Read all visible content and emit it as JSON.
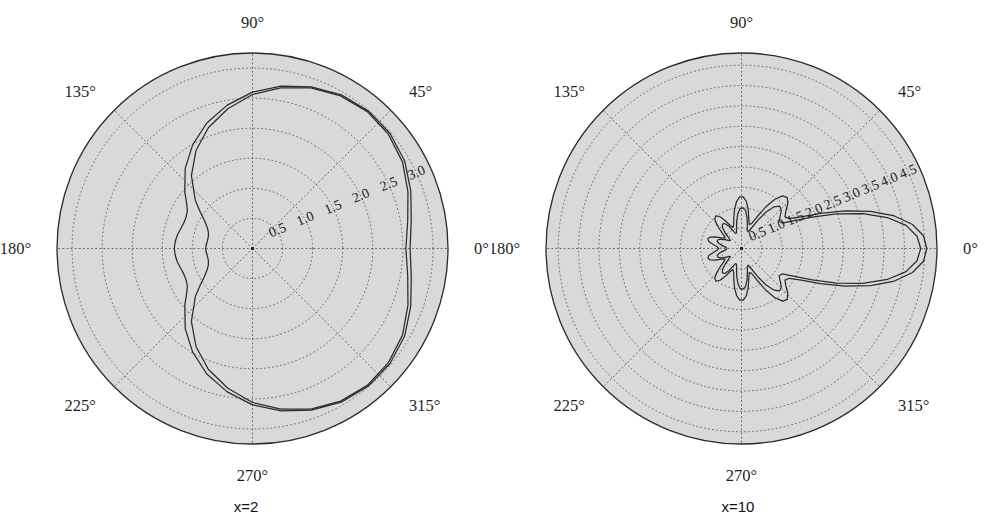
{
  "figure": {
    "panels": [
      {
        "id": "panel-x2",
        "caption": "x=2",
        "center": {
          "x": 252.5,
          "y": 248.5
        },
        "radius": 195.5,
        "angle_ticks": [
          "0°",
          "45°",
          "90°",
          "135°",
          "180°",
          "225°",
          "270°",
          "315°"
        ],
        "angle_tick_values": [
          0,
          45,
          90,
          135,
          180,
          225,
          270,
          315
        ],
        "radial_ticks": [
          "0.5",
          "1.0",
          "1.5",
          "2.0",
          "2.5",
          "3.0"
        ],
        "radial_tick_values": [
          0.5,
          1.0,
          1.5,
          2.0,
          2.5,
          3.0
        ],
        "rmax": 3.25,
        "radial_label_angle": 22.5
      },
      {
        "id": "panel-x10",
        "caption": "x=10",
        "center": {
          "x": 249.5,
          "y": 248.5
        },
        "radius": 195.5,
        "angle_ticks": [
          "0°",
          "45°",
          "90°",
          "135°",
          "180°",
          "225°",
          "270°",
          "315°"
        ],
        "angle_tick_values": [
          0,
          45,
          90,
          135,
          180,
          225,
          270,
          315
        ],
        "radial_ticks": [
          "0.5",
          "1.0",
          "1.5",
          "2.0",
          "2.5",
          "3.0",
          "3.5",
          "4.0",
          "4.5"
        ],
        "radial_tick_values": [
          0.5,
          1.0,
          1.5,
          2.0,
          2.5,
          3.0,
          3.5,
          4.0,
          4.5
        ],
        "rmax": 4.8,
        "radial_label_angle": 22.5
      }
    ]
  },
  "style": {
    "bg_fill": "#d9d9d9",
    "grid_color": "#4a4a4a",
    "outline_color": "#2a2a2a",
    "curve_color": "#2b2b2b",
    "text_color": "#1f1f1f",
    "page_bg": "#ffffff"
  },
  "chart_data": {
    "type": "line",
    "subtype": "polar",
    "title": "",
    "xlabel": "",
    "ylabel": "",
    "grid": true,
    "legend_position": "none",
    "panels": [
      {
        "caption": "x=2",
        "rlim": [
          0,
          3.25
        ],
        "rticks": [
          0.5,
          1.0,
          1.5,
          2.0,
          2.5,
          3.0
        ],
        "thetaticks": [
          0,
          45,
          90,
          135,
          180,
          225,
          270,
          315
        ],
        "series": [
          {
            "name": "curve-1",
            "theta_deg": [
              0,
              10,
              20,
              30,
              40,
              50,
              60,
              70,
              80,
              90,
              100,
              110,
              120,
              130,
              140,
              145,
              150,
              155,
              160,
              165,
              170,
              175,
              180,
              185,
              190,
              195,
              200,
              205,
              210,
              215,
              220,
              230,
              240,
              250,
              260,
              270,
              280,
              290,
              300,
              310,
              320,
              330,
              340,
              350,
              360
            ],
            "r": [
              2.62,
              2.68,
              2.8,
              2.92,
              2.98,
              2.99,
              2.95,
              2.86,
              2.74,
              2.6,
              2.42,
              2.22,
              1.99,
              1.74,
              1.47,
              1.34,
              1.25,
              1.22,
              1.22,
              1.24,
              1.27,
              1.29,
              1.3,
              1.29,
              1.27,
              1.24,
              1.22,
              1.22,
              1.25,
              1.34,
              1.47,
              1.74,
              1.99,
              2.22,
              2.42,
              2.6,
              2.74,
              2.86,
              2.95,
              2.99,
              2.98,
              2.92,
              2.8,
              2.68,
              2.62
            ]
          },
          {
            "name": "curve-2",
            "theta_deg": [
              0,
              10,
              20,
              30,
              40,
              50,
              60,
              70,
              80,
              90,
              100,
              110,
              120,
              130,
              140,
              145,
              150,
              155,
              160,
              165,
              170,
              175,
              180,
              185,
              190,
              195,
              200,
              205,
              210,
              215,
              220,
              230,
              240,
              250,
              260,
              270,
              280,
              290,
              300,
              310,
              320,
              330,
              340,
              350,
              360
            ],
            "r": [
              2.55,
              2.62,
              2.75,
              2.88,
              2.95,
              2.97,
              2.93,
              2.84,
              2.71,
              2.56,
              2.36,
              2.14,
              1.88,
              1.58,
              1.24,
              1.06,
              0.92,
              0.83,
              0.78,
              0.76,
              0.76,
              0.77,
              0.78,
              0.77,
              0.76,
              0.76,
              0.78,
              0.83,
              0.92,
              1.06,
              1.24,
              1.58,
              1.88,
              2.14,
              2.36,
              2.56,
              2.71,
              2.84,
              2.93,
              2.97,
              2.95,
              2.88,
              2.75,
              2.62,
              2.55
            ]
          }
        ]
      },
      {
        "caption": "x=10",
        "rlim": [
          0,
          4.8
        ],
        "rticks": [
          0.5,
          1.0,
          1.5,
          2.0,
          2.5,
          3.0,
          3.5,
          4.0,
          4.5
        ],
        "thetaticks": [
          0,
          45,
          90,
          135,
          180,
          225,
          270,
          315
        ],
        "series": [
          {
            "name": "curve-1",
            "theta_deg": [
              0,
              4,
              8,
              12,
              16,
              20,
              24,
              28,
              32,
              36,
              40,
              44,
              48,
              52,
              56,
              60,
              64,
              68,
              72,
              76,
              80,
              84,
              88,
              92,
              96,
              100,
              104,
              108,
              112,
              116,
              120,
              124,
              128,
              132,
              136,
              140,
              144,
              148,
              152,
              156,
              160,
              164,
              168,
              172,
              176,
              180,
              184,
              188,
              192,
              196,
              200,
              204,
              208,
              212,
              216,
              220,
              224,
              228,
              232,
              236,
              240,
              244,
              248,
              252,
              256,
              260,
              264,
              268,
              272,
              276,
              280,
              284,
              288,
              292,
              296,
              300,
              304,
              308,
              312,
              316,
              320,
              324,
              328,
              332,
              336,
              340,
              344,
              348,
              352,
              356,
              360
            ],
            "r": [
              4.55,
              4.48,
              4.24,
              3.84,
              3.3,
              2.7,
              2.12,
              1.66,
              1.38,
              1.32,
              1.42,
              1.58,
              1.68,
              1.64,
              1.45,
              1.16,
              0.86,
              0.66,
              0.62,
              0.74,
              0.96,
              1.16,
              1.27,
              1.27,
              1.16,
              0.98,
              0.78,
              0.62,
              0.56,
              0.62,
              0.78,
              0.94,
              1.02,
              0.98,
              0.84,
              0.66,
              0.52,
              0.48,
              0.56,
              0.7,
              0.82,
              0.86,
              0.82,
              0.7,
              0.6,
              0.56,
              0.6,
              0.7,
              0.82,
              0.86,
              0.82,
              0.7,
              0.56,
              0.48,
              0.52,
              0.66,
              0.84,
              0.98,
              1.02,
              0.94,
              0.78,
              0.62,
              0.56,
              0.62,
              0.78,
              0.98,
              1.16,
              1.27,
              1.27,
              1.16,
              0.96,
              0.74,
              0.62,
              0.66,
              0.86,
              1.16,
              1.45,
              1.64,
              1.68,
              1.58,
              1.42,
              1.32,
              1.38,
              1.66,
              2.12,
              2.7,
              3.3,
              3.84,
              4.24,
              4.48,
              4.55
            ]
          },
          {
            "name": "curve-2",
            "theta_deg": [
              0,
              4,
              8,
              12,
              16,
              20,
              24,
              28,
              32,
              36,
              40,
              44,
              48,
              52,
              56,
              60,
              64,
              68,
              72,
              76,
              80,
              84,
              88,
              92,
              96,
              100,
              104,
              108,
              112,
              116,
              120,
              124,
              128,
              132,
              136,
              140,
              144,
              148,
              152,
              156,
              160,
              164,
              168,
              172,
              176,
              180,
              184,
              188,
              192,
              196,
              200,
              204,
              208,
              212,
              216,
              220,
              224,
              228,
              232,
              236,
              240,
              244,
              248,
              252,
              256,
              260,
              264,
              268,
              272,
              276,
              280,
              284,
              288,
              292,
              296,
              300,
              304,
              308,
              312,
              316,
              320,
              324,
              328,
              332,
              336,
              340,
              344,
              348,
              352,
              356,
              360
            ],
            "r": [
              4.4,
              4.32,
              4.08,
              3.66,
              3.1,
              2.48,
              1.9,
              1.44,
              1.18,
              1.14,
              1.24,
              1.36,
              1.4,
              1.3,
              1.08,
              0.8,
              0.56,
              0.44,
              0.46,
              0.6,
              0.78,
              0.94,
              1.0,
              0.98,
              0.86,
              0.68,
              0.5,
              0.4,
              0.4,
              0.5,
              0.64,
              0.74,
              0.76,
              0.7,
              0.56,
              0.42,
              0.34,
              0.36,
              0.46,
              0.56,
              0.62,
              0.62,
              0.56,
              0.46,
              0.38,
              0.36,
              0.38,
              0.46,
              0.56,
              0.62,
              0.62,
              0.56,
              0.46,
              0.36,
              0.34,
              0.42,
              0.56,
              0.7,
              0.76,
              0.74,
              0.64,
              0.5,
              0.4,
              0.4,
              0.5,
              0.68,
              0.86,
              0.98,
              1.0,
              0.94,
              0.78,
              0.6,
              0.46,
              0.44,
              0.56,
              0.8,
              1.08,
              1.3,
              1.4,
              1.36,
              1.24,
              1.14,
              1.18,
              1.44,
              1.9,
              2.48,
              3.1,
              3.66,
              4.08,
              4.32,
              4.4
            ]
          }
        ]
      }
    ]
  }
}
